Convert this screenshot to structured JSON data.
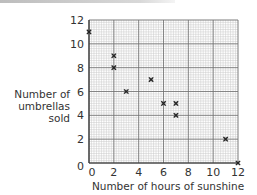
{
  "chart_data": {
    "type": "scatter",
    "title": "",
    "xlabel": "Number of hours of sunshine",
    "ylabel": "Number of umbrellas sold",
    "xlim": [
      0,
      12
    ],
    "ylim": [
      0,
      12
    ],
    "x_ticks": [
      0,
      2,
      4,
      6,
      8,
      10,
      12
    ],
    "y_ticks": [
      0,
      2,
      4,
      6,
      8,
      10,
      12
    ],
    "grid": true,
    "marker": "x",
    "points": [
      {
        "x": 0,
        "y": 11
      },
      {
        "x": 2,
        "y": 9
      },
      {
        "x": 2,
        "y": 8
      },
      {
        "x": 3,
        "y": 6
      },
      {
        "x": 5,
        "y": 7
      },
      {
        "x": 6,
        "y": 5
      },
      {
        "x": 7,
        "y": 5
      },
      {
        "x": 7,
        "y": 4
      },
      {
        "x": 11,
        "y": 2
      },
      {
        "x": 12,
        "y": 0
      }
    ]
  },
  "labels": {
    "y_axis_line1": "Number of",
    "y_axis_line2": "umbrellas sold",
    "x_axis": "Number of hours of sunshine"
  },
  "colors": {
    "grid_minor": "#c8c8c8",
    "grid_major": "#6e6e6e",
    "marker": "#222222"
  }
}
